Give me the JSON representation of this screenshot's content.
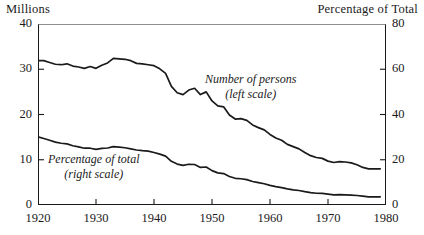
{
  "captions": {
    "left": "Millions",
    "right": "Percentage of Total"
  },
  "annotations": {
    "persons": {
      "line1": "Number of persons",
      "line2": "(left scale)"
    },
    "percent": {
      "line1": "Percentage of total",
      "line2": "(right scale)"
    }
  },
  "axes": {
    "y_left_ticks": [
      "0",
      "10",
      "20",
      "30",
      "40"
    ],
    "y_right_ticks": [
      "0",
      "20",
      "40",
      "60",
      "80"
    ],
    "x_ticks": [
      "1920",
      "1930",
      "1940",
      "1950",
      "1960",
      "1970",
      "1980"
    ]
  },
  "colors": {
    "line": "#1a1a1a",
    "frame": "#1a1a1a",
    "frame_top": "#8e8e8e",
    "background": "#ffffff",
    "text": "#1a1a1a"
  },
  "chart_data": {
    "type": "line",
    "title": "",
    "subtitle": "",
    "xlabel": "",
    "ylabel": "Millions",
    "y2label": "Percentage of Total",
    "xlim": [
      1920,
      1980
    ],
    "ylim": [
      0,
      40
    ],
    "y2lim": [
      0,
      80
    ],
    "grid": false,
    "legend": "inline-annotations",
    "x": [
      1920,
      1921,
      1922,
      1923,
      1924,
      1925,
      1926,
      1927,
      1928,
      1929,
      1930,
      1931,
      1932,
      1933,
      1934,
      1935,
      1936,
      1937,
      1938,
      1939,
      1940,
      1941,
      1942,
      1943,
      1944,
      1945,
      1946,
      1947,
      1948,
      1949,
      1950,
      1951,
      1952,
      1953,
      1954,
      1955,
      1956,
      1957,
      1958,
      1959,
      1960,
      1961,
      1962,
      1963,
      1964,
      1965,
      1966,
      1967,
      1968,
      1969,
      1970,
      1971,
      1972,
      1973,
      1974,
      1975,
      1976,
      1977,
      1978,
      1979
    ],
    "series": [
      {
        "name": "Number of persons",
        "scale": "left",
        "unit": "millions",
        "values": [
          31.9,
          31.9,
          31.5,
          31.1,
          31.0,
          31.2,
          30.7,
          30.5,
          30.2,
          30.6,
          30.2,
          30.9,
          31.4,
          32.4,
          32.3,
          32.2,
          31.9,
          31.3,
          31.2,
          31.0,
          30.8,
          30.1,
          29.1,
          26.2,
          24.8,
          24.4,
          25.4,
          25.8,
          24.4,
          25.0,
          23.0,
          21.9,
          21.7,
          19.9,
          19.0,
          19.1,
          18.7,
          17.7,
          17.1,
          16.6,
          15.6,
          14.8,
          14.3,
          13.4,
          12.9,
          12.4,
          11.6,
          10.9,
          10.5,
          10.3,
          9.7,
          9.4,
          9.6,
          9.5,
          9.3,
          8.9,
          8.3,
          8.0,
          8.0,
          8.0
        ]
      },
      {
        "name": "Percentage of total",
        "scale": "right",
        "unit": "percent",
        "values": [
          30.1,
          29.4,
          28.6,
          27.8,
          27.3,
          27.0,
          26.2,
          25.7,
          25.1,
          25.1,
          24.6,
          25.0,
          25.2,
          25.8,
          25.6,
          25.3,
          24.8,
          24.3,
          24.0,
          23.8,
          23.2,
          22.5,
          21.6,
          19.3,
          18.1,
          17.5,
          18.0,
          17.9,
          16.6,
          16.8,
          15.2,
          14.2,
          13.9,
          12.6,
          11.8,
          11.6,
          11.2,
          10.4,
          9.9,
          9.4,
          8.7,
          8.1,
          7.7,
          7.1,
          6.7,
          6.4,
          5.9,
          5.5,
          5.2,
          5.1,
          4.8,
          4.5,
          4.6,
          4.5,
          4.4,
          4.2,
          3.9,
          3.6,
          3.6,
          3.6
        ]
      }
    ]
  }
}
